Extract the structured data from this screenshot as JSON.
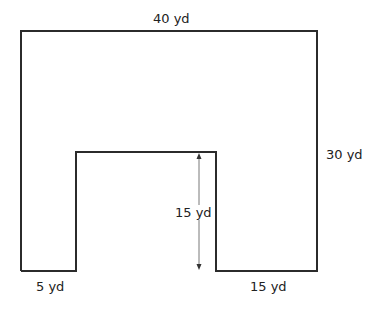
{
  "diagram": {
    "shape": "U-shaped floor plan",
    "colors": {
      "outline": "#2b2b2b",
      "arrow": "#555555",
      "background": "#ffffff"
    },
    "labels": {
      "top_width": "40 yd",
      "right_height": "30 yd",
      "inner_height": "15 yd",
      "left_bottom_width": "5 yd",
      "right_bottom_width": "15 yd"
    },
    "dimensions": {
      "outer_width_yd": 40,
      "outer_height_yd": 30,
      "notch_height_yd": 15,
      "left_leg_width_yd": 5,
      "right_leg_width_yd": 15
    }
  }
}
